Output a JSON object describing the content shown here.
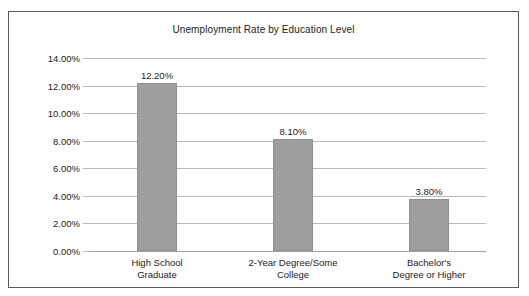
{
  "chart_data": {
    "type": "bar",
    "title": "Unemployment Rate by Education Level",
    "xlabel": "",
    "ylabel": "",
    "categories": [
      "High School Graduate",
      "2-Year Degree/Some College",
      "Bachelor's Degree or Higher"
    ],
    "category_lines": [
      [
        "High School",
        "Graduate"
      ],
      [
        "2-Year Degree/Some",
        "College"
      ],
      [
        "Bachelor's",
        "Degree or Higher"
      ]
    ],
    "values": [
      12.2,
      8.1,
      3.8
    ],
    "value_labels": [
      "12.20%",
      "8.10%",
      "3.80%"
    ],
    "ylim": [
      0,
      14
    ],
    "ytick_values": [
      14,
      12,
      10,
      8,
      6,
      4,
      2,
      0
    ],
    "ytick_labels": [
      "14.00%",
      "12.00%",
      "10.00%",
      "8.00%",
      "6.00%",
      "4.00%",
      "2.00%",
      "0.00%"
    ],
    "grid": true,
    "legend": false,
    "bar_color": "#9e9e9e",
    "bar_border_color": "#8f8f8f",
    "gridline_color": "#b9b9b9",
    "text_color": "#1c1c1c",
    "frame_color": "#58595b"
  }
}
